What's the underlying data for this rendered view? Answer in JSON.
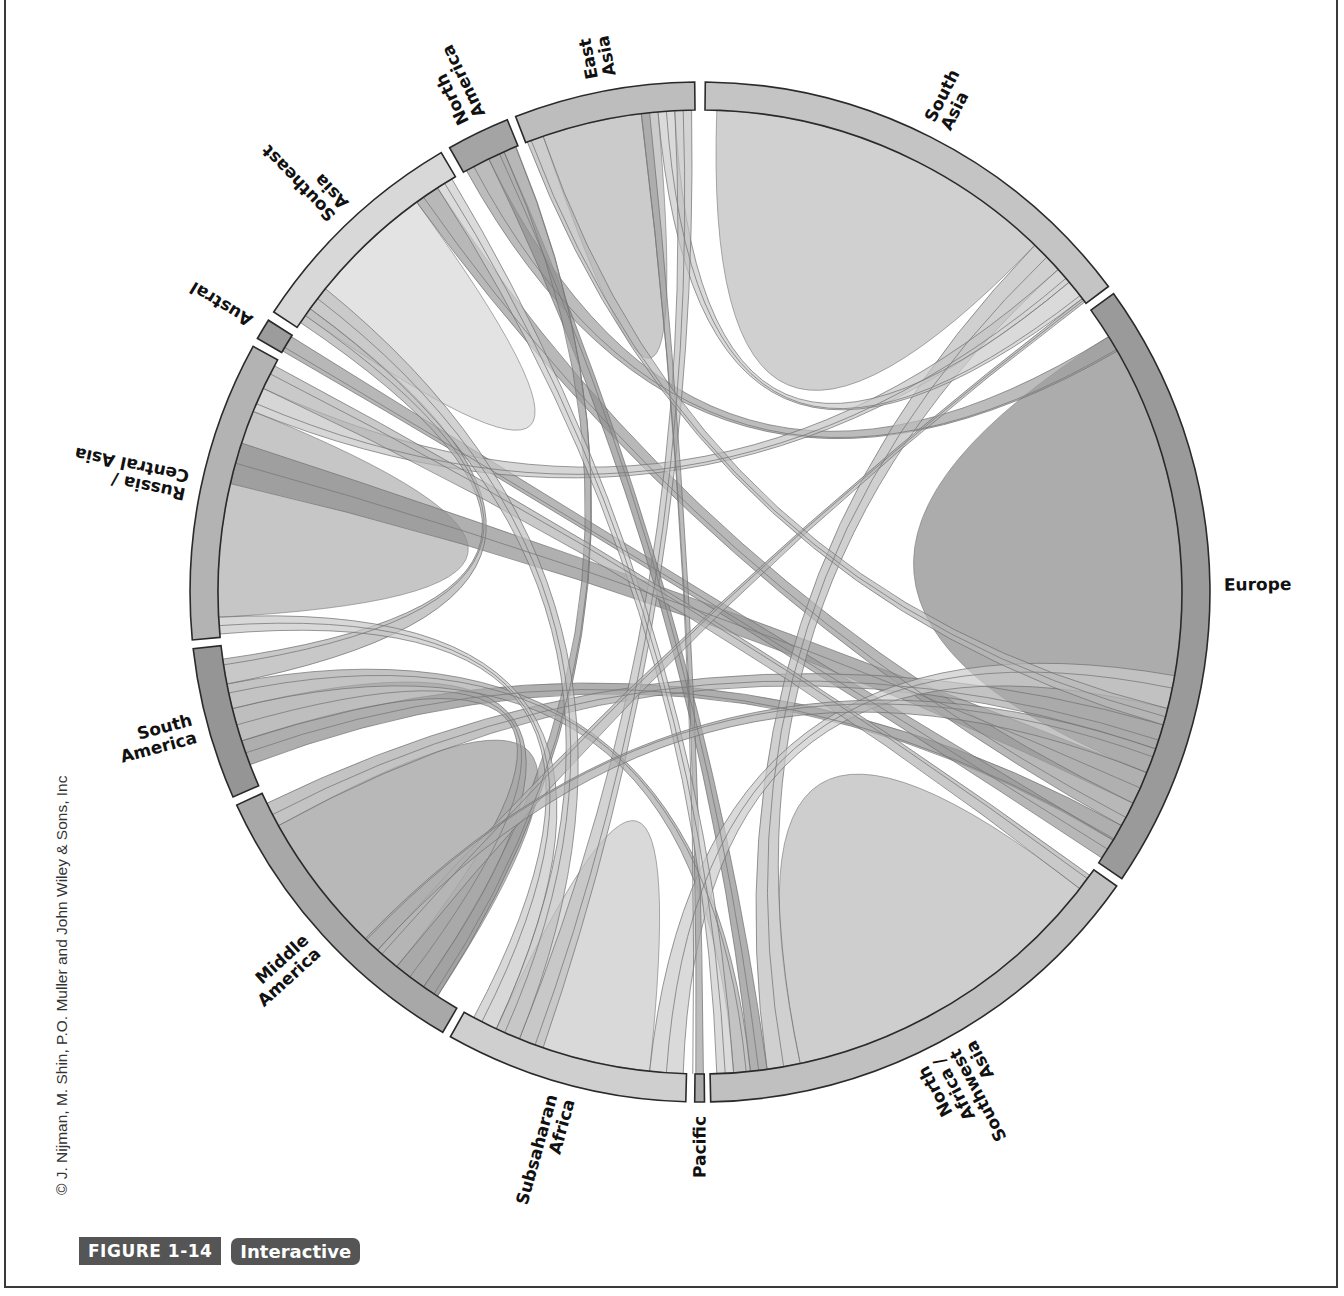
{
  "figure": {
    "number_label": "FIGURE 1-14",
    "interactive_label": "Interactive",
    "credit": "© J. Nijman, M. Shin, P.O. Muller and John Wiley & Sons, Inc"
  },
  "chart_data": {
    "type": "chord",
    "title": "",
    "grid": false,
    "legend": "none",
    "center": [
      700,
      592
    ],
    "outer_radius": 510,
    "ring_width": 28,
    "segments": [
      {
        "name": "South Asia",
        "label_lines": [
          "South",
          "Asia"
        ],
        "start": 0.6,
        "end": 53.2,
        "color": "#c4c4c4"
      },
      {
        "name": "Europe",
        "label_lines": [
          "Europe"
        ],
        "start": 54.2,
        "end": 124.2,
        "color": "#9a9a9a"
      },
      {
        "name": "North Africa / Southwest Asia",
        "label_lines": [
          "North",
          "Africa /",
          "Southwest",
          "Asia"
        ],
        "start": 125.2,
        "end": 178.8,
        "color": "#c0c0c0"
      },
      {
        "name": "Pacific",
        "label_lines": [
          "Pacific"
        ],
        "start": 179.5,
        "end": 180.6,
        "color": "#aaaaaa"
      },
      {
        "name": "Subsaharan Africa",
        "label_lines": [
          "Subsaharan",
          "Africa"
        ],
        "start": 181.6,
        "end": 209.3,
        "color": "#cfcfcf"
      },
      {
        "name": "Middle America",
        "label_lines": [
          "Middle",
          "America"
        ],
        "start": 210.3,
        "end": 245.3,
        "color": "#a8a8a8"
      },
      {
        "name": "South America",
        "label_lines": [
          "South",
          "America"
        ],
        "start": 246.3,
        "end": 263.6,
        "color": "#959595"
      },
      {
        "name": "Russia / Central Asia",
        "label_lines": [
          "Russia /",
          "Central Asia"
        ],
        "start": 264.6,
        "end": 298.8,
        "color": "#b3b3b3"
      },
      {
        "name": "Austral",
        "label_lines": [
          "Austral"
        ],
        "start": 299.8,
        "end": 302.2,
        "color": "#9c9c9c"
      },
      {
        "name": "Southeast Asia",
        "label_lines": [
          "Southeast",
          "Asia"
        ],
        "start": 303.3,
        "end": 329.5,
        "color": "#d8d8d8"
      },
      {
        "name": "North America",
        "label_lines": [
          "North",
          "America"
        ],
        "start": 330.6,
        "end": 337.8,
        "color": "#a4a4a4"
      },
      {
        "name": "East Asia",
        "label_lines": [
          "East",
          "Asia"
        ],
        "start": 338.8,
        "end": 359.4,
        "color": "#bdbdbd"
      }
    ],
    "self_flows": [
      {
        "segment": "South Asia",
        "from": [
          2,
          44
        ],
        "color": "#c8c8c8"
      },
      {
        "segment": "Europe",
        "from": [
          58,
          112
        ],
        "color": "#9e9e9e"
      },
      {
        "segment": "North Africa / Southwest Asia",
        "from": [
          128,
          168
        ],
        "color": "#c6c6c6"
      },
      {
        "segment": "Subsaharan Africa",
        "from": [
          186,
          205
        ],
        "color": "#d2d2d2"
      },
      {
        "segment": "Middle America",
        "from": [
          213,
          241
        ],
        "color": "#acacac"
      },
      {
        "segment": "Russia / Central Asia",
        "from": [
          267,
          292
        ],
        "color": "#bcbcbc"
      },
      {
        "segment": "Southeast Asia",
        "from": [
          305,
          324
        ],
        "color": "#dedede"
      },
      {
        "segment": "East Asia",
        "from": [
          341,
          355
        ],
        "color": "#c2c2c2"
      }
    ],
    "flows": [
      {
        "source": "Europe",
        "s": [
          112,
          116
        ],
        "target": "Russia / Central Asia",
        "t": [
          283,
          288
        ],
        "color": "#8e8e8e"
      },
      {
        "source": "Europe",
        "s": [
          116,
          119
        ],
        "target": "Southeast Asia",
        "t": [
          324,
          327
        ],
        "color": "#9a9a9a"
      },
      {
        "source": "Europe",
        "s": [
          119,
          121
        ],
        "target": "South America",
        "t": [
          249,
          252
        ],
        "color": "#8c8c8c"
      },
      {
        "source": "Europe",
        "s": [
          121,
          123.5
        ],
        "target": "Austral",
        "t": [
          300,
          302
        ],
        "color": "#999999"
      },
      {
        "source": "Europe",
        "s": [
          106,
          109
        ],
        "target": "Middle America",
        "t": [
          241,
          244
        ],
        "color": "#aaaaaa"
      },
      {
        "source": "Europe",
        "s": [
          58,
          60
        ],
        "target": "North America",
        "t": [
          331,
          334
        ],
        "color": "#a0a0a0"
      },
      {
        "source": "South Asia",
        "s": [
          44,
          48
        ],
        "target": "North Africa / Southwest Asia",
        "t": [
          168,
          172
        ],
        "color": "#bcbcbc"
      },
      {
        "source": "South Asia",
        "s": [
          48,
          50
        ],
        "target": "Russia / Central Asia",
        "t": [
          292,
          295
        ],
        "color": "#c4c4c4"
      },
      {
        "source": "South Asia",
        "s": [
          50,
          52.5
        ],
        "target": "East Asia",
        "t": [
          355,
          357
        ],
        "color": "#cacaca"
      },
      {
        "source": "East Asia",
        "s": [
          357,
          359
        ],
        "target": "Subsaharan Africa",
        "t": [
          199,
          202
        ],
        "color": "#c0c0c0"
      },
      {
        "source": "North America",
        "s": [
          334,
          336
        ],
        "target": "North Africa / Southwest Asia",
        "t": [
          172,
          174
        ],
        "color": "#8f8f8f"
      },
      {
        "source": "North America",
        "s": [
          336,
          337.5
        ],
        "target": "Middle America",
        "t": [
          213,
          215
        ],
        "color": "#999999"
      },
      {
        "source": "Middle America",
        "s": [
          215,
          219
        ],
        "target": "South America",
        "t": [
          252,
          256
        ],
        "color": "#a3a3a3"
      },
      {
        "source": "South America",
        "s": [
          256,
          259
        ],
        "target": "North Africa / Southwest Asia",
        "t": [
          174,
          176
        ],
        "color": "#a9a9a9"
      },
      {
        "source": "South America",
        "s": [
          259,
          262
        ],
        "target": "Southeast Asia",
        "t": [
          304,
          306
        ],
        "color": "#b0b0b0"
      },
      {
        "source": "Subsaharan Africa",
        "s": [
          182,
          186
        ],
        "target": "Europe",
        "t": [
          100,
          104
        ],
        "color": "#cacaca"
      },
      {
        "source": "Subsaharan Africa",
        "s": [
          205,
          208
        ],
        "target": "Russia / Central Asia",
        "t": [
          265,
          267
        ],
        "color": "#c8c8c8"
      },
      {
        "source": "Pacific",
        "s": [
          179.6,
          180.5
        ],
        "target": "East Asia",
        "t": [
          353,
          354
        ],
        "color": "#a0a0a0"
      },
      {
        "source": "Southeast Asia",
        "s": [
          327,
          329
        ],
        "target": "North Africa / Southwest Asia",
        "t": [
          176,
          178
        ],
        "color": "#cccccc"
      },
      {
        "source": "Russia / Central Asia",
        "s": [
          295,
          298
        ],
        "target": "North Africa / Southwest Asia",
        "t": [
          126,
          128
        ],
        "color": "#b2b2b2"
      },
      {
        "source": "Middle America",
        "s": [
          219,
          222
        ],
        "target": "South Asia",
        "t": [
          52.5,
          53
        ],
        "color": "#b4b4b4"
      },
      {
        "source": "Europe",
        "s": [
          104,
          106
        ],
        "target": "East Asia",
        "t": [
          339,
          341
        ],
        "color": "#b8b8b8"
      },
      {
        "source": "Subsaharan Africa",
        "s": [
          202,
          205
        ],
        "target": "Southeast Asia",
        "t": [
          306,
          309
        ],
        "color": "#bfbfbf"
      },
      {
        "source": "Middle America",
        "s": [
          222,
          224
        ],
        "target": "Europe",
        "t": [
          109,
          112
        ],
        "color": "#adadad"
      }
    ]
  }
}
